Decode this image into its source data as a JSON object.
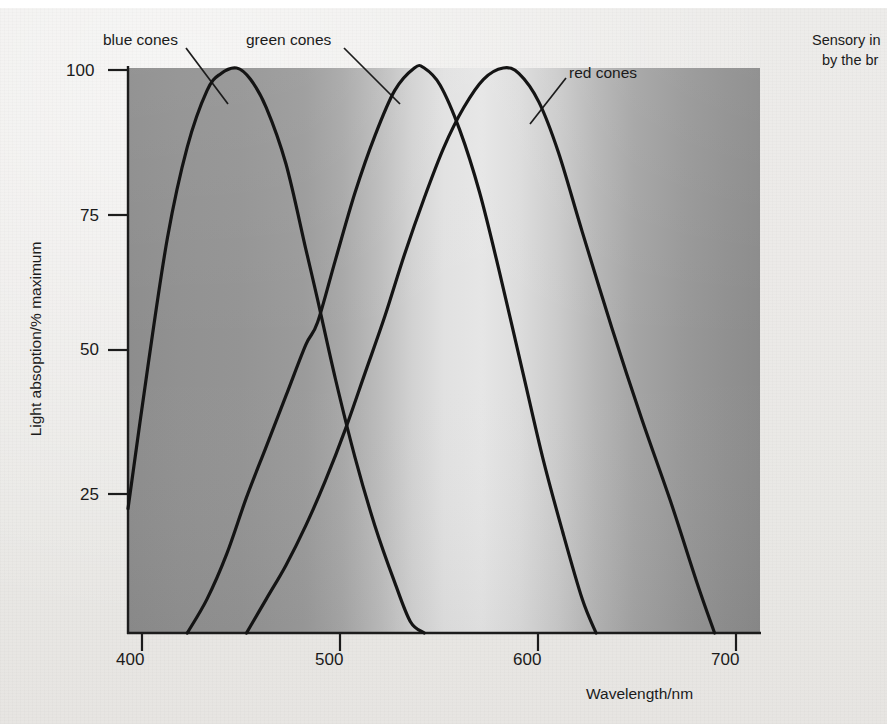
{
  "figure": {
    "side_note_line1": "Sensory in",
    "side_note_line2": "by the br"
  },
  "chart_data": {
    "type": "line",
    "title": "",
    "xlabel": "Wavelength/nm",
    "ylabel": "Light absoption/% maximum",
    "xlim": [
      390,
      710
    ],
    "ylim": [
      0,
      105
    ],
    "xticks": [
      400,
      500,
      600,
      700
    ],
    "xtick_labels": [
      "400",
      "500",
      "600",
      "700"
    ],
    "yticks": [
      25,
      50,
      75,
      100
    ],
    "ytick_labels": [
      "25",
      "50",
      "75",
      "100"
    ],
    "grid": false,
    "legend": "inline-annotations",
    "background": "visible-light-spectrum-gradient",
    "annotations": [
      {
        "text": "blue cones",
        "x": 412,
        "y": 118,
        "points_to_x": 437,
        "points_to_y": 88
      },
      {
        "text": "green cones",
        "x": 470,
        "y": 118,
        "points_to_x": 531,
        "points_to_y": 88
      },
      {
        "text": "red cones",
        "x": 600,
        "y": 104,
        "points_to_x": 578,
        "points_to_y": 78
      }
    ],
    "series": [
      {
        "name": "blue cones",
        "peak_wavelength_nm": 445,
        "peak_value": 100,
        "x": [
          390,
          400,
          410,
          420,
          430,
          437,
          445,
          452,
          460,
          470,
          480,
          486,
          495,
          505,
          515,
          525,
          533,
          540
        ],
        "values": [
          22,
          47,
          70,
          86,
          96,
          99,
          100,
          98,
          93,
          83,
          68,
          59,
          45,
          31,
          19,
          9,
          2,
          0
        ]
      },
      {
        "name": "green cones",
        "peak_wavelength_nm": 540,
        "peak_value": 100,
        "x": [
          420,
          430,
          440,
          450,
          460,
          470,
          480,
          486,
          495,
          505,
          515,
          525,
          535,
          540,
          548,
          558,
          568,
          578,
          590,
          600,
          610,
          620,
          627
        ],
        "values": [
          0,
          6,
          14,
          24,
          33,
          42,
          51,
          55,
          66,
          78,
          88,
          96,
          100,
          100,
          97,
          89,
          78,
          64,
          46,
          31,
          18,
          6,
          0
        ]
      },
      {
        "name": "red cones",
        "peak_wavelength_nm": 580,
        "peak_value": 100,
        "x": [
          450,
          460,
          470,
          480,
          490,
          500,
          510,
          520,
          530,
          540,
          550,
          560,
          570,
          580,
          588,
          598,
          608,
          620,
          635,
          650,
          665,
          678,
          687
        ],
        "values": [
          0,
          6,
          12,
          19,
          27,
          36,
          46,
          56,
          67,
          77,
          86,
          93,
          98,
          100,
          99,
          94,
          85,
          71,
          54,
          38,
          23,
          9,
          0
        ]
      }
    ]
  }
}
